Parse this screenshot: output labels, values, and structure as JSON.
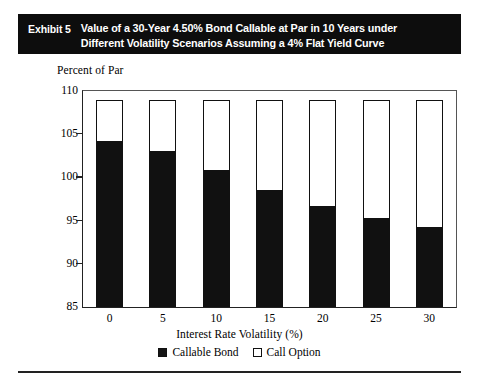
{
  "exhibit": {
    "label": "Exhibit 5",
    "title_line1": "Value of a 30-Year 4.50% Bond Callable at Par in 10 Years under",
    "title_line2": "Different Volatility Scenarios Assuming a 4% Flat Yield Curve",
    "banner_bg": "#0d0d0d",
    "banner_fg": "#ffffff"
  },
  "chart_data": {
    "type": "bar",
    "stacked": true,
    "title": "Value of a 30-Year 4.50% Bond Callable at Par in 10 Years under Different Volatility Scenarios Assuming a 4% Flat Yield Curve",
    "subtitle": "",
    "xlabel": "Interest Rate Volatility (%)",
    "ylabel": "Percent of Par",
    "categories": [
      "0",
      "5",
      "10",
      "15",
      "20",
      "25",
      "30"
    ],
    "ylim": [
      85,
      110
    ],
    "yticks": [
      85,
      90,
      95,
      100,
      105,
      110
    ],
    "grid": false,
    "legend_position": "bottom",
    "series": [
      {
        "name": "Callable Bond",
        "color": "#151515",
        "values": [
          104.2,
          103.0,
          100.8,
          98.5,
          96.7,
          95.3,
          94.3
        ]
      },
      {
        "name": "Call Option",
        "color": "#ffffff",
        "values": [
          4.8,
          6.0,
          8.2,
          10.5,
          12.3,
          13.7,
          14.7
        ]
      }
    ],
    "totals": [
      109.0,
      109.0,
      109.0,
      109.0,
      109.0,
      109.0,
      109.0
    ]
  },
  "legend": {
    "items": [
      {
        "label": "Callable Bond",
        "swatch": "filled"
      },
      {
        "label": "Call Option",
        "swatch": "hollow"
      }
    ]
  }
}
